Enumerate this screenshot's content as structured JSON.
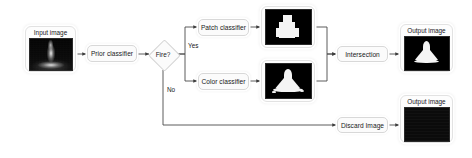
{
  "diagram": {
    "background_color": "#ffffff",
    "line_color": "#404040",
    "box_fill": "#fbfbfb",
    "box_border": "#d8d8d8"
  },
  "nodes": {
    "input_image": {
      "caption": "Input image",
      "thumbnail": "grayscale-flame-photo"
    },
    "prior_classifier": {
      "label": "Prior classifier"
    },
    "decision": {
      "label": "Fire?"
    },
    "patch_classifier": {
      "label": "Patch classifier"
    },
    "color_classifier": {
      "label": "Color classifier"
    },
    "patch_mask": {
      "thumbnail": "binary-patch-mask"
    },
    "color_mask": {
      "thumbnail": "binary-color-mask"
    },
    "intersection": {
      "label": "Intersection"
    },
    "discard": {
      "label": "Discard Image"
    },
    "output_image_top": {
      "caption": "Output image",
      "thumbnail": "binary-intersection-mask"
    },
    "output_image_bottom": {
      "caption": "Output image",
      "thumbnail": "black-blank-image"
    }
  },
  "edges": {
    "yes_label": "Yes",
    "no_label": "No"
  }
}
